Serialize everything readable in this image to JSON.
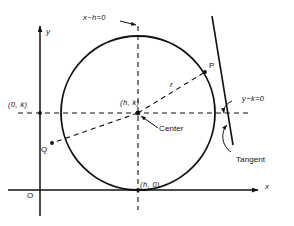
{
  "figure": {
    "type": "geometry-diagram",
    "colors": {
      "ink": "#111111",
      "background": "#ffffff"
    },
    "axes": {
      "x_label": "x",
      "y_label": "y",
      "origin_label": "O"
    },
    "labels": {
      "vertical_line": "x−h=0",
      "horizontal_line": "y−k=0",
      "y_intercept_point": "(0, k)",
      "center_point": "(h, k)",
      "center_callout": "Center",
      "bottom_point": "(h, 0)",
      "radius": "r",
      "point_p": "P",
      "point_q": "Q",
      "tangent_callout": "Tangent"
    },
    "geometry": {
      "circle": {
        "cx": 138,
        "cy": 113,
        "r": 77
      },
      "center_dot": {
        "cx": 138,
        "cy": 113,
        "r": 2.2
      },
      "point_p": {
        "x": 205,
        "y": 72
      },
      "point_q": {
        "x": 52,
        "y": 143
      },
      "y_axis_point": {
        "x": 40,
        "y": 113
      },
      "bottom_point": {
        "x": 138,
        "y": 190
      },
      "x_axis_y": 190,
      "y_axis_x": 40
    }
  }
}
